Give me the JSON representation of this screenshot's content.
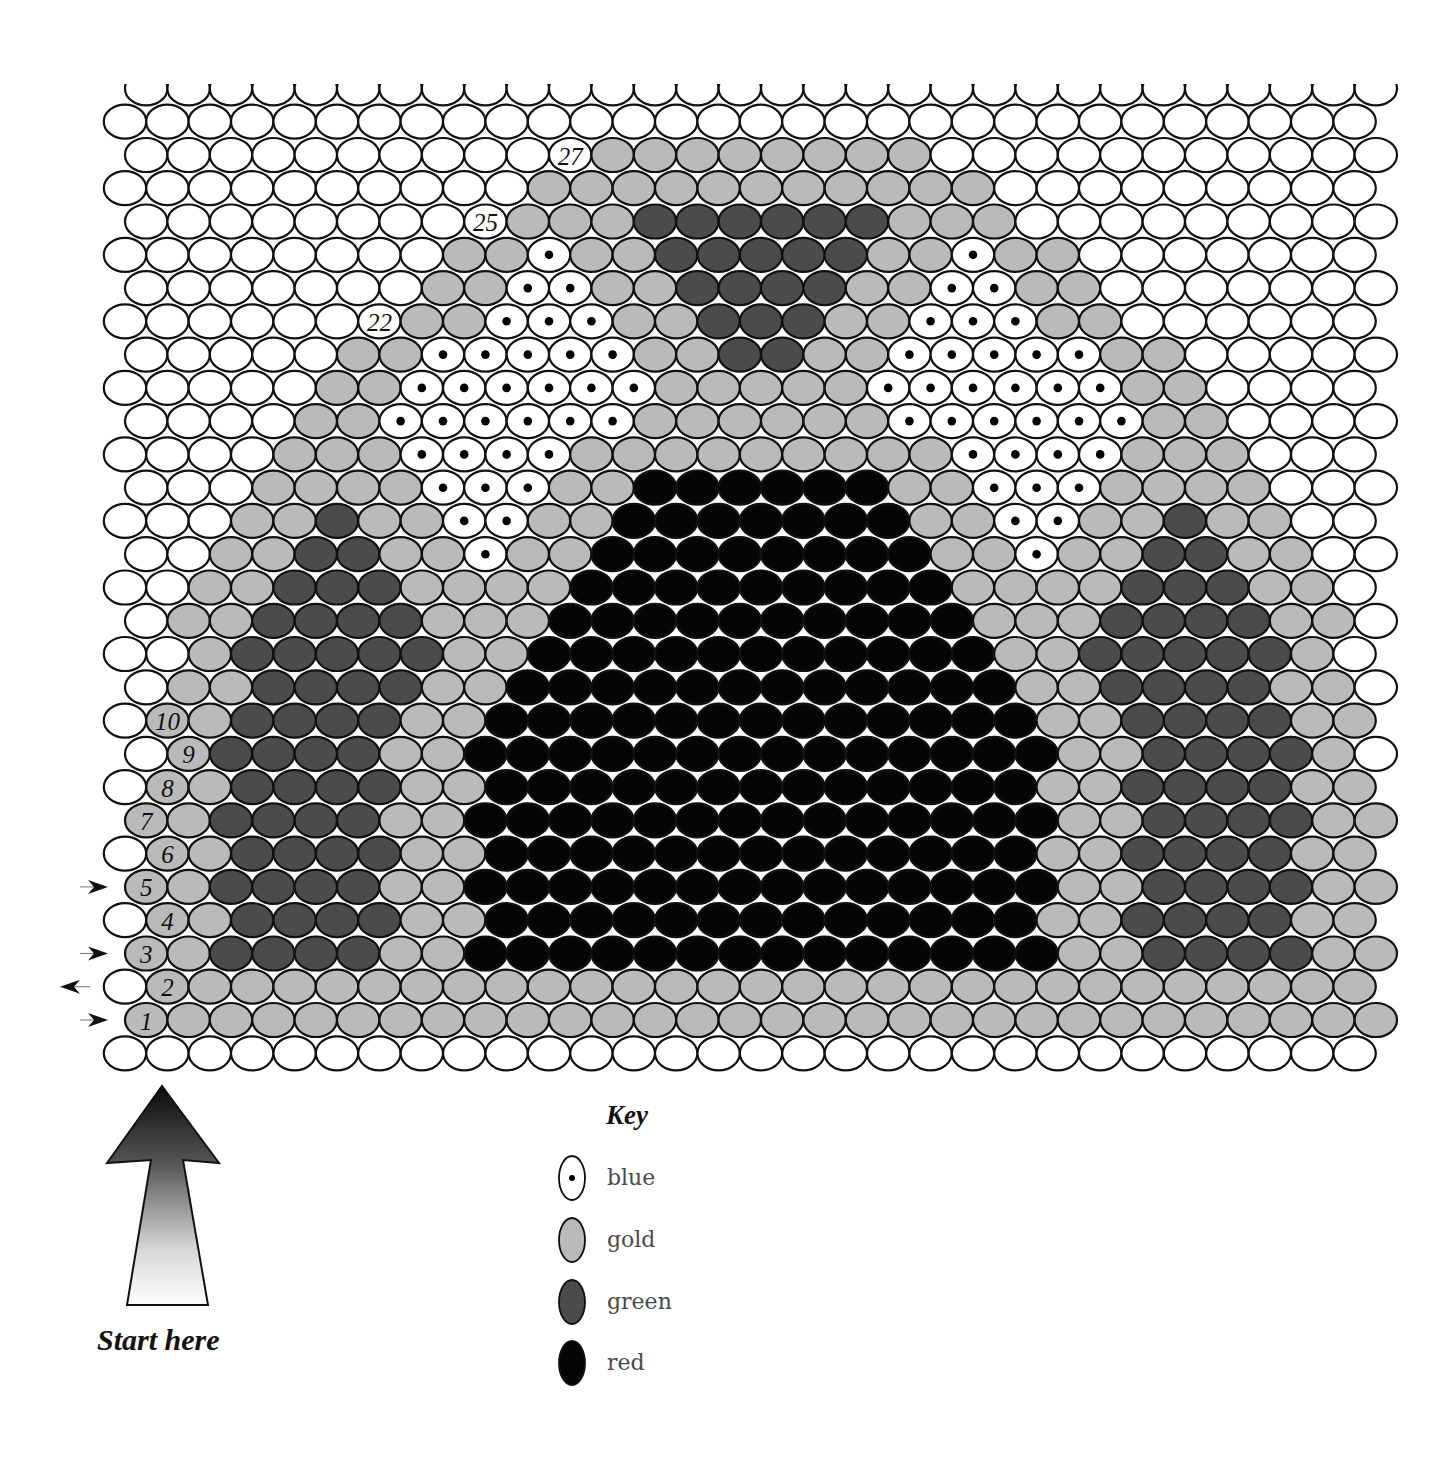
{
  "colors": {
    "W": {
      "name": "white",
      "fill": "#ffffff"
    },
    "G": {
      "name": "gold",
      "fill": "#bababa"
    },
    "N": {
      "name": "green",
      "fill": "#4b4b4b"
    },
    "R": {
      "name": "red",
      "fill": "#050505"
    },
    "B": {
      "name": "blue",
      "fill": "#ffffff",
      "dot": "#000000"
    }
  },
  "grid": {
    "beads_per_row": 30,
    "row_order": "bottom-to-top",
    "rows": [
      {
        "row": 0,
        "beads": "WWWWWWWWWWWWWWWWWWWWWWWWWWWWWW"
      },
      {
        "row": 1,
        "beads": "GGGGGGGGGGGGGGGGGGGGGGGGGGGGGG",
        "label": "1",
        "label_index": 0,
        "arrow": "right"
      },
      {
        "row": 2,
        "beads": "WGGGGGGGGGGGGGGGGGGGGGGGGGGGGG",
        "label": "2",
        "label_index": 1,
        "arrow": "left"
      },
      {
        "row": 3,
        "beads": "GGNNNNGGRRRRRRRRRRRRRRGGNNNNGG",
        "label": "3",
        "label_index": 0,
        "arrow": "right"
      },
      {
        "row": 4,
        "beads": "WGGNNNNGGRRRRRRRRRRRRRGGNNNNGG",
        "label": "4",
        "label_index": 1
      },
      {
        "row": 5,
        "beads": "GGNNNNGGRRRRRRRRRRRRRRGGNNNNGG",
        "label": "5",
        "label_index": 0,
        "arrow": "right"
      },
      {
        "row": 6,
        "beads": "WGGNNNNGGRRRRRRRRRRRRRGGNNNNGG",
        "label": "6",
        "label_index": 1
      },
      {
        "row": 7,
        "beads": "GGNNNNGGRRRRRRRRRRRRRRGGNNNNGG",
        "label": "7",
        "label_index": 0
      },
      {
        "row": 8,
        "beads": "WGGNNNNGGRRRRRRRRRRRRRGGNNNNGG",
        "label": "8",
        "label_index": 1
      },
      {
        "row": 9,
        "beads": "WGNNNNGGRRRRRRRRRRRRRRGGNNNNGW",
        "label": "9",
        "label_index": 1
      },
      {
        "row": 10,
        "beads": "WGGNNNNGGRRRRRRRRRRRRRGGNNNNGG",
        "label": "10",
        "label_index": 1
      },
      {
        "row": 11,
        "beads": "WGGNNNNGGRRRRRRRRRRRRGGNNNNGGW"
      },
      {
        "row": 12,
        "beads": "WWGNNNNNGGRRRRRRRRRRRGGNNNNNGW"
      },
      {
        "row": 13,
        "beads": "WGGNNNNGGGRRRRRRRRRRGGGNNNNGGW"
      },
      {
        "row": 14,
        "beads": "WWGGNNNGGGGRRRRRRRRRGGGGNNNGGW"
      },
      {
        "row": 15,
        "beads": "WWGGNNGGBGGRRRRRRRRGGBGGNNGGWW"
      },
      {
        "row": 16,
        "beads": "WWWGGNGGBBGGRRRRRRRGGBBGGNGGWW"
      },
      {
        "row": 17,
        "beads": "WWWGGGGBBBGGRRRRRRGGBBBGGGGWWW"
      },
      {
        "row": 18,
        "beads": "WWWWGGGBBBBGGGGGGGGGBBBBGGGWWW"
      },
      {
        "row": 19,
        "beads": "WWWWGGBBBBBBGGGGGGBBBBBBGGWWWW"
      },
      {
        "row": 20,
        "beads": "WWWWWGGBBBBBBGGGGGBBBBBBGGWWWW"
      },
      {
        "row": 21,
        "beads": "WWWWWGGBBBBBGGNNGGBBBBBGGWWWWW"
      },
      {
        "row": 22,
        "beads": "WWWWWWWGGBBBGGNNNGGBBBGGWWWWWW",
        "label": "22",
        "label_index": 6
      },
      {
        "row": 23,
        "beads": "WWWWWWWGGBBGGNNNNGGBBGGWWWWWWW"
      },
      {
        "row": 24,
        "beads": "WWWWWWWWGGBGGNNNNNGGBGGWWWWWWW"
      },
      {
        "row": 25,
        "beads": "WWWWWWWWWGGGNNNNNNGGGWWWWWWWWW",
        "label": "25",
        "label_index": 8
      },
      {
        "row": 26,
        "beads": "WWWWWWWWWWGGGGGGGGGGGWWWWWWWWW"
      },
      {
        "row": 27,
        "beads": "WWWWWWWWWWWGGGGGGGGWWWWWWWWWWW",
        "label": "27",
        "label_index": 10
      },
      {
        "row": 28,
        "beads": "WWWWWWWWWWWWWWWWWWWWWWWWWWWWWW"
      },
      {
        "row": 29,
        "beads": "WWWWWWWWWWWWWWWWWWWWWWWWWWWWWW",
        "clipped_top": true
      }
    ]
  },
  "key": {
    "title": "Key",
    "items": [
      {
        "code": "B",
        "label": "blue"
      },
      {
        "code": "G",
        "label": "gold"
      },
      {
        "code": "N",
        "label": "green"
      },
      {
        "code": "R",
        "label": "red"
      }
    ]
  },
  "start": {
    "label": "Start here",
    "arrow": "up-arrow"
  }
}
